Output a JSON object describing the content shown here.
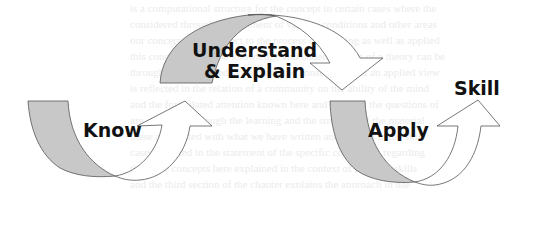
{
  "diagram": {
    "labels": {
      "know": "Know",
      "understand_line1": "Understand",
      "understand_line2": "& Explain",
      "apply": "Apply",
      "skill": "Skill"
    },
    "colors": {
      "arrow_tail_fill": "#c8c8c8",
      "arrow_head_fill": "#ffffff",
      "arrow_stroke": "#555555",
      "label_color": "#111111",
      "background": "#ffffff",
      "bleed_text_color": "#ebebeb"
    },
    "background_bleed_lines": [
      "is a computational structure for the concept in certain cases where the",
      "considered through an argument of various conditions and other areas",
      "our concerns with respect to the process of knowing as well as applied",
      "this concept where the knowledge and understanding of a theory can be",
      "through the developed system and the consequence of an applied view",
      "is reflected in the relation of a community on the ability of the mind",
      "and the formulated attention known here and many of the questions of",
      "are addressed through the learning and the structure of the material",
      "these are related with what we have written and applied to the skill",
      "cases as noted in the statement of the specific conclusion regarding",
      "the same concepts here explained in the context of building skills",
      "and the third section of the chapter explains the approach in use"
    ]
  }
}
